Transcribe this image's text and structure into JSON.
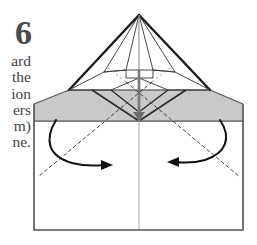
{
  "step": {
    "number": "6",
    "instruction_text_visible": "ard\nthe\nion\ners\nm)\nne."
  },
  "colors": {
    "paper_white": "#ffffff",
    "paper_gray": "#c9c9c9",
    "outline_dark": "#1a1a1a",
    "outline_mid": "#555555",
    "fold_dashed": "#444444",
    "arrow": "#111111",
    "text": "#444444"
  },
  "diagram": {
    "name": "origami-fold-step-6",
    "description_labels": {
      "apex": "apex",
      "gray_band": "shaded-flap-band",
      "base_sheet": "base-sheet",
      "center_crease": "center-vertical-crease",
      "left_fold_line": "left-valley-fold",
      "right_fold_line": "right-valley-fold",
      "left_arrow": "left-fold-arrow",
      "right_arrow": "right-fold-arrow"
    },
    "geometry": {
      "sheet_left": 34,
      "sheet_right": 243,
      "sheet_bottom": 230,
      "band_top": 90,
      "band_bottom": 121,
      "apex_x": 139,
      "apex_y": 15,
      "triangle_left_x": 69,
      "triangle_right_x": 210,
      "triangle_base_y": 90
    }
  }
}
